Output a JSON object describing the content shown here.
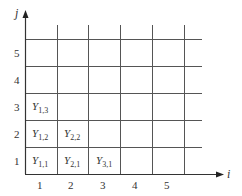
{
  "diagram": {
    "type": "lattice grid",
    "x_axis": {
      "name": "i",
      "ticks": [
        "1",
        "2",
        "3",
        "4",
        "5"
      ]
    },
    "y_axis": {
      "name": "j",
      "ticks": [
        "1",
        "2",
        "3",
        "4",
        "5"
      ]
    },
    "cells": [
      {
        "i": 1,
        "j": 1,
        "label": "Y",
        "sub": "1,1"
      },
      {
        "i": 2,
        "j": 1,
        "label": "Y",
        "sub": "2,1"
      },
      {
        "i": 3,
        "j": 1,
        "label": "Y",
        "sub": "3,1"
      },
      {
        "i": 1,
        "j": 2,
        "label": "Y",
        "sub": "1,2"
      },
      {
        "i": 2,
        "j": 2,
        "label": "Y",
        "sub": "2,2"
      },
      {
        "i": 1,
        "j": 3,
        "label": "Y",
        "sub": "1,3"
      }
    ],
    "colors": {
      "line": "#3a3a3a",
      "grid": "#555555",
      "text": "#333333"
    }
  }
}
